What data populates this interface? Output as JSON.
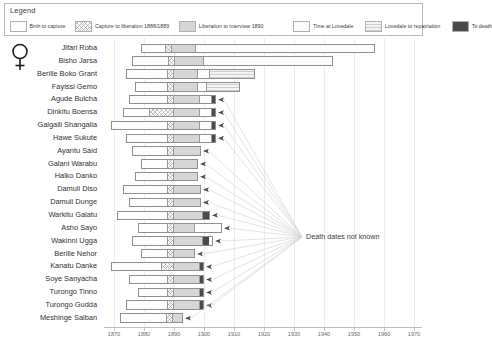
{
  "legend": {
    "title": "Legend",
    "items": [
      {
        "label": "Birth to capture",
        "key": "birth",
        "color": "#fdfdfd"
      },
      {
        "label": "Capture to liberation 1888/1889",
        "key": "capture",
        "color": "#fbfbfb"
      },
      {
        "label": "Liberation to interview 1890",
        "key": "liberation",
        "color": "#d6d6d6"
      },
      {
        "label": "Time at Lovedale",
        "key": "lovedale",
        "color": "#fcfcfc"
      },
      {
        "label": "Lovedale to repatriation",
        "key": "repat",
        "color": "#f4f4f4"
      },
      {
        "label": "To death",
        "key": "death",
        "color": "#4a4a4a"
      }
    ]
  },
  "gender_symbol": "venus-female-symbol",
  "annotation": {
    "text": "Death dates not known",
    "x": 306,
    "y": 194
  },
  "chart_data": {
    "type": "bar",
    "subtype": "timeline-gantt",
    "title": "",
    "xlabel": "",
    "ylabel": "",
    "xlim": [
      1868,
      1972
    ],
    "xticks": [
      1870,
      1880,
      1890,
      1900,
      1910,
      1920,
      1930,
      1940,
      1950,
      1960,
      1970
    ],
    "xtick_labels": [
      "1870",
      "1880",
      "1890",
      "1900",
      "1910",
      "1920",
      "1930",
      "1940",
      "1950",
      "1960",
      "1970"
    ],
    "grid": true,
    "legend_position": "top",
    "segment_order": [
      "birth",
      "capture",
      "liberation",
      "lovedale",
      "repat",
      "death"
    ],
    "categories": [
      "Jifari Roba",
      "Bisho Jarsa",
      "Berille Boko Grant",
      "Fayissi Gemo",
      "Agude Bulcha",
      "Dinkitu Boensa",
      "Galgalli Shangalla",
      "Hawe Sukute",
      "Ayantu Said",
      "Galani Warabu",
      "Halko Danko",
      "Damuli Diso",
      "Damuli Dunge",
      "Warkitu Galatu",
      "Asho Sayo",
      "Wakinni Ugga",
      "Berille Nehor",
      "Kanatu Danke",
      "Soye Sanyacha",
      "Turongo Tinno",
      "Turongo Gudda",
      "Meshinge Salban"
    ],
    "series": [
      {
        "name": "Jifari Roba",
        "birth": 1879,
        "capture": 1887,
        "liberation": 1889,
        "interview": 1890,
        "lovedale_end": 1897,
        "repatriation": null,
        "death": 1957,
        "death_known": true,
        "segments": [
          {
            "key": "birth",
            "start": 1879,
            "end": 1887
          },
          {
            "key": "capture",
            "start": 1887,
            "end": 1889
          },
          {
            "key": "liberation",
            "start": 1889,
            "end": 1897
          },
          {
            "key": "lovedale",
            "start": 1897,
            "end": 1957
          }
        ]
      },
      {
        "name": "Bisho Jarsa",
        "birth": 1876,
        "capture": 1888,
        "liberation": 1890,
        "interview": 1890,
        "lovedale_end": 1900,
        "repatriation": null,
        "death": 1943,
        "death_known": true,
        "segments": [
          {
            "key": "birth",
            "start": 1876,
            "end": 1888
          },
          {
            "key": "capture",
            "start": 1888,
            "end": 1890
          },
          {
            "key": "liberation",
            "start": 1890,
            "end": 1900
          },
          {
            "key": "lovedale",
            "start": 1900,
            "end": 1943
          }
        ]
      },
      {
        "name": "Berille Boko Grant",
        "birth": 1874,
        "capture": 1888,
        "liberation": 1890,
        "interview": 1890,
        "lovedale_end": 1899,
        "repatriation": 1902,
        "death": 1917,
        "death_known": true,
        "segments": [
          {
            "key": "birth",
            "start": 1874,
            "end": 1888
          },
          {
            "key": "capture",
            "start": 1888,
            "end": 1890
          },
          {
            "key": "liberation",
            "start": 1890,
            "end": 1898
          },
          {
            "key": "lovedale",
            "start": 1898,
            "end": 1902
          },
          {
            "key": "repat",
            "start": 1902,
            "end": 1917
          }
        ]
      },
      {
        "name": "Fayissi Gemo",
        "birth": 1877,
        "capture": 1888,
        "liberation": 1890,
        "interview": 1890,
        "lovedale_end": 1898,
        "repatriation": 1901,
        "death": 1912,
        "death_known": true,
        "segments": [
          {
            "key": "birth",
            "start": 1877,
            "end": 1888
          },
          {
            "key": "capture",
            "start": 1888,
            "end": 1890
          },
          {
            "key": "liberation",
            "start": 1890,
            "end": 1898
          },
          {
            "key": "lovedale",
            "start": 1898,
            "end": 1901
          },
          {
            "key": "repat",
            "start": 1901,
            "end": 1912
          }
        ]
      },
      {
        "name": "Agude Bulcha",
        "birth": 1875,
        "capture": 1888,
        "liberation": 1890,
        "interview": 1890,
        "lovedale_end": 1899,
        "repatriation": 1903,
        "death": null,
        "death_known": false,
        "segments": [
          {
            "key": "birth",
            "start": 1875,
            "end": 1888
          },
          {
            "key": "capture",
            "start": 1888,
            "end": 1890
          },
          {
            "key": "liberation",
            "start": 1890,
            "end": 1899
          },
          {
            "key": "lovedale",
            "start": 1899,
            "end": 1903
          },
          {
            "key": "death",
            "start": 1903,
            "end": 1904
          }
        ]
      },
      {
        "name": "Dinkitu Boensa",
        "birth": 1873,
        "capture": 1888,
        "liberation": 1890,
        "interview": 1890,
        "lovedale_end": 1899,
        "repatriation": 1903,
        "death": null,
        "death_known": false,
        "segments": [
          {
            "key": "birth",
            "start": 1873,
            "end": 1882
          },
          {
            "key": "capture",
            "start": 1882,
            "end": 1890
          },
          {
            "key": "liberation",
            "start": 1890,
            "end": 1899
          },
          {
            "key": "lovedale",
            "start": 1899,
            "end": 1903
          },
          {
            "key": "death",
            "start": 1903,
            "end": 1904
          }
        ]
      },
      {
        "name": "Galgalli Shangalla",
        "birth": 1869,
        "capture": 1888,
        "liberation": 1890,
        "interview": 1890,
        "lovedale_end": 1899,
        "repatriation": 1903,
        "death": null,
        "death_known": false,
        "segments": [
          {
            "key": "birth",
            "start": 1869,
            "end": 1888
          },
          {
            "key": "capture",
            "start": 1888,
            "end": 1890
          },
          {
            "key": "liberation",
            "start": 1890,
            "end": 1899
          },
          {
            "key": "lovedale",
            "start": 1899,
            "end": 1903
          },
          {
            "key": "death",
            "start": 1903,
            "end": 1904
          }
        ]
      },
      {
        "name": "Hawe Sukute",
        "birth": 1874,
        "capture": 1888,
        "liberation": 1890,
        "interview": 1890,
        "lovedale_end": 1899,
        "repatriation": 1903,
        "death": null,
        "death_known": false,
        "segments": [
          {
            "key": "birth",
            "start": 1874,
            "end": 1888
          },
          {
            "key": "capture",
            "start": 1888,
            "end": 1890
          },
          {
            "key": "liberation",
            "start": 1890,
            "end": 1899
          },
          {
            "key": "lovedale",
            "start": 1899,
            "end": 1903
          },
          {
            "key": "death",
            "start": 1903,
            "end": 1904
          }
        ]
      },
      {
        "name": "Ayantu Said",
        "birth": 1876,
        "capture": 1888,
        "liberation": 1890,
        "interview": 1890,
        "lovedale_end": 1899,
        "repatriation": null,
        "death": null,
        "death_known": false,
        "segments": [
          {
            "key": "birth",
            "start": 1876,
            "end": 1888
          },
          {
            "key": "capture",
            "start": 1888,
            "end": 1890
          },
          {
            "key": "liberation",
            "start": 1890,
            "end": 1899
          }
        ]
      },
      {
        "name": "Galani Warabu",
        "birth": 1879,
        "capture": 1888,
        "liberation": 1890,
        "interview": 1890,
        "lovedale_end": 1898,
        "repatriation": null,
        "death": null,
        "death_known": false,
        "segments": [
          {
            "key": "birth",
            "start": 1879,
            "end": 1888
          },
          {
            "key": "capture",
            "start": 1888,
            "end": 1890
          },
          {
            "key": "liberation",
            "start": 1890,
            "end": 1898
          }
        ]
      },
      {
        "name": "Halko Danko",
        "birth": 1877,
        "capture": 1888,
        "liberation": 1890,
        "interview": 1890,
        "lovedale_end": 1898,
        "repatriation": null,
        "death": null,
        "death_known": false,
        "segments": [
          {
            "key": "birth",
            "start": 1877,
            "end": 1888
          },
          {
            "key": "capture",
            "start": 1888,
            "end": 1890
          },
          {
            "key": "liberation",
            "start": 1890,
            "end": 1898
          }
        ]
      },
      {
        "name": "Damuli Diso",
        "birth": 1873,
        "capture": 1888,
        "liberation": 1890,
        "interview": 1890,
        "lovedale_end": 1899,
        "repatriation": null,
        "death": null,
        "death_known": false,
        "segments": [
          {
            "key": "birth",
            "start": 1873,
            "end": 1888
          },
          {
            "key": "capture",
            "start": 1888,
            "end": 1890
          },
          {
            "key": "liberation",
            "start": 1890,
            "end": 1899
          }
        ]
      },
      {
        "name": "Damuli Dunge",
        "birth": 1875,
        "capture": 1888,
        "liberation": 1890,
        "interview": 1890,
        "lovedale_end": 1899,
        "repatriation": null,
        "death": null,
        "death_known": false,
        "segments": [
          {
            "key": "birth",
            "start": 1875,
            "end": 1888
          },
          {
            "key": "capture",
            "start": 1888,
            "end": 1890
          },
          {
            "key": "liberation",
            "start": 1890,
            "end": 1899
          }
        ]
      },
      {
        "name": "Warkitu Galatu",
        "birth": 1871,
        "capture": 1888,
        "liberation": 1890,
        "interview": 1890,
        "lovedale_end": 1900,
        "repatriation": 1902,
        "death": null,
        "death_known": false,
        "segments": [
          {
            "key": "birth",
            "start": 1871,
            "end": 1888
          },
          {
            "key": "capture",
            "start": 1888,
            "end": 1890
          },
          {
            "key": "liberation",
            "start": 1890,
            "end": 1900
          },
          {
            "key": "death",
            "start": 1900,
            "end": 1902
          }
        ]
      },
      {
        "name": "Asho Sayo",
        "birth": 1878,
        "capture": 1888,
        "liberation": 1890,
        "interview": 1890,
        "lovedale_end": 1898,
        "repatriation": 1906,
        "death": null,
        "death_known": false,
        "segments": [
          {
            "key": "birth",
            "start": 1878,
            "end": 1888
          },
          {
            "key": "capture",
            "start": 1888,
            "end": 1890
          },
          {
            "key": "liberation",
            "start": 1890,
            "end": 1897
          },
          {
            "key": "lovedale",
            "start": 1897,
            "end": 1906
          }
        ]
      },
      {
        "name": "Wakinni Ugga",
        "birth": 1876,
        "capture": 1888,
        "liberation": 1890,
        "interview": 1890,
        "lovedale_end": 1899,
        "repatriation": 1902,
        "death": null,
        "death_known": false,
        "segments": [
          {
            "key": "birth",
            "start": 1876,
            "end": 1888
          },
          {
            "key": "capture",
            "start": 1888,
            "end": 1890
          },
          {
            "key": "liberation",
            "start": 1890,
            "end": 1900
          },
          {
            "key": "death",
            "start": 1901,
            "end": 1903
          }
        ]
      },
      {
        "name": "Berille Nehor",
        "birth": 1879,
        "capture": 1888,
        "liberation": 1890,
        "interview": 1890,
        "lovedale_end": 1897,
        "repatriation": null,
        "death": null,
        "death_known": false,
        "segments": [
          {
            "key": "birth",
            "start": 1879,
            "end": 1888
          },
          {
            "key": "capture",
            "start": 1888,
            "end": 1890
          },
          {
            "key": "liberation",
            "start": 1890,
            "end": 1897
          }
        ]
      },
      {
        "name": "Kanatu Danke",
        "birth": 1869,
        "capture": 1887,
        "liberation": 1889,
        "interview": 1890,
        "lovedale_end": 1899,
        "repatriation": null,
        "death": null,
        "death_known": false,
        "segments": [
          {
            "key": "birth",
            "start": 1869,
            "end": 1886
          },
          {
            "key": "capture",
            "start": 1886,
            "end": 1890
          },
          {
            "key": "liberation",
            "start": 1890,
            "end": 1899
          },
          {
            "key": "death",
            "start": 1899,
            "end": 1900
          }
        ]
      },
      {
        "name": "Soye Sanyacha",
        "birth": 1875,
        "capture": 1888,
        "liberation": 1890,
        "interview": 1890,
        "lovedale_end": 1899,
        "repatriation": null,
        "death": null,
        "death_known": false,
        "segments": [
          {
            "key": "birth",
            "start": 1875,
            "end": 1888
          },
          {
            "key": "capture",
            "start": 1888,
            "end": 1890
          },
          {
            "key": "liberation",
            "start": 1890,
            "end": 1899
          },
          {
            "key": "death",
            "start": 1899,
            "end": 1900
          }
        ]
      },
      {
        "name": "Turongo Tinno",
        "birth": 1878,
        "capture": 1888,
        "liberation": 1890,
        "interview": 1890,
        "lovedale_end": 1899,
        "repatriation": null,
        "death": null,
        "death_known": false,
        "segments": [
          {
            "key": "birth",
            "start": 1878,
            "end": 1888
          },
          {
            "key": "capture",
            "start": 1888,
            "end": 1890
          },
          {
            "key": "liberation",
            "start": 1890,
            "end": 1899
          },
          {
            "key": "death",
            "start": 1899,
            "end": 1900
          }
        ]
      },
      {
        "name": "Turongo Gudda",
        "birth": 1874,
        "capture": 1888,
        "liberation": 1890,
        "interview": 1890,
        "lovedale_end": 1899,
        "repatriation": null,
        "death": null,
        "death_known": false,
        "segments": [
          {
            "key": "birth",
            "start": 1874,
            "end": 1888
          },
          {
            "key": "capture",
            "start": 1888,
            "end": 1890
          },
          {
            "key": "liberation",
            "start": 1890,
            "end": 1899
          },
          {
            "key": "death",
            "start": 1899,
            "end": 1900
          }
        ]
      },
      {
        "name": "Meshinge Salban",
        "birth": 1872,
        "capture": 1888,
        "liberation": 1890,
        "interview": 1890,
        "lovedale_end": 1893,
        "repatriation": null,
        "death": null,
        "death_known": false,
        "segments": [
          {
            "key": "birth",
            "start": 1872,
            "end": 1888
          },
          {
            "key": "capture",
            "start": 1888,
            "end": 1890
          },
          {
            "key": "liberation",
            "start": 1890,
            "end": 1893
          }
        ]
      }
    ]
  }
}
